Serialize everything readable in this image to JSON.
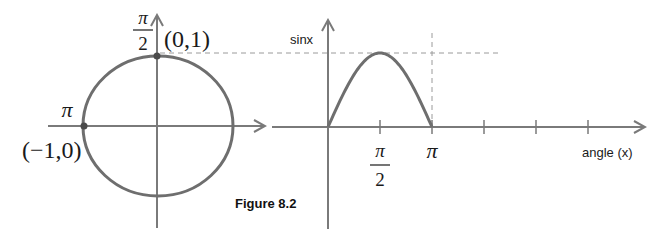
{
  "figure": {
    "caption": "Figure 8.2",
    "colors": {
      "curve": "#6e6e6e",
      "axis": "#7a7a7a",
      "dash": "#9a9a9a",
      "point": "#4a4a4a",
      "text": "#1a1a1a"
    }
  },
  "unit_circle": {
    "top_angle_num": "π",
    "top_angle_den": "2",
    "top_point_label": "(0,1)",
    "left_angle_label": "π",
    "left_point_label": "(−1,0)",
    "points": [
      {
        "name": "top",
        "x": 0,
        "y": 1
      },
      {
        "name": "left",
        "x": -1,
        "y": 0
      }
    ]
  },
  "chart_data": {
    "type": "line",
    "title": "",
    "ylabel": "sinx",
    "xlabel": "angle (x)",
    "x_ticks": [
      {
        "value": 1.5708,
        "label_num": "π",
        "label_den": "2"
      },
      {
        "value": 3.1416,
        "label": "π"
      },
      {
        "value": 4.7124,
        "label": ""
      },
      {
        "value": 6.2832,
        "label": ""
      },
      {
        "value": 7.854,
        "label": ""
      }
    ],
    "xlim": [
      0,
      8.9
    ],
    "ylim": [
      0,
      1.5
    ],
    "series": [
      {
        "name": "sin x",
        "x_range": [
          0,
          3.1416
        ],
        "function": "sin(x)"
      }
    ],
    "reference_lines": [
      {
        "type": "horizontal",
        "y": 1,
        "style": "dashed"
      },
      {
        "type": "vertical",
        "x": 3.1416,
        "style": "dashed"
      }
    ]
  }
}
